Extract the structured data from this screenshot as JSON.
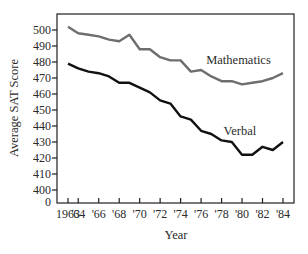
{
  "chart_data": {
    "type": "line",
    "title": "",
    "xlabel": "Year",
    "ylabel": "Average SAT Score",
    "x": [
      1963,
      1964,
      1965,
      1966,
      1967,
      1968,
      1969,
      1970,
      1971,
      1972,
      1973,
      1974,
      1975,
      1976,
      1977,
      1978,
      1979,
      1980,
      1981,
      1982,
      1983,
      1984
    ],
    "x_tick_labels": [
      "1963",
      "'64",
      "'66",
      "'68",
      "'70",
      "'72",
      "'74",
      "'76",
      "'78",
      "'80",
      "'82",
      "'84"
    ],
    "x_tick_values": [
      1963,
      1964,
      1966,
      1968,
      1970,
      1972,
      1974,
      1976,
      1978,
      1980,
      1982,
      1984
    ],
    "y_tick_labels": [
      "0",
      "400",
      "410",
      "420",
      "430",
      "440",
      "450",
      "460",
      "470",
      "480",
      "490",
      "500"
    ],
    "y_tick_values": [
      400,
      410,
      420,
      430,
      440,
      450,
      460,
      470,
      480,
      490,
      500
    ],
    "y_axis_break": true,
    "ylim": [
      400,
      510
    ],
    "grid": false,
    "legend": "inline labels",
    "series": [
      {
        "name": "Mathematics",
        "color": "#6e6e6e",
        "values": [
          502,
          498,
          497,
          496,
          494,
          493,
          497,
          488,
          488,
          483,
          481,
          481,
          474,
          475,
          471,
          468,
          468,
          466,
          467,
          468,
          470,
          473
        ]
      },
      {
        "name": "Verbal",
        "color": "#111111",
        "values": [
          479,
          476,
          474,
          473,
          471,
          467,
          467,
          464,
          461,
          456,
          454,
          446,
          444,
          437,
          435,
          431,
          430,
          422,
          422,
          427,
          425,
          430
        ]
      }
    ],
    "annotations": [
      {
        "text": "Mathematics",
        "x": 1976.5,
        "y": 481
      },
      {
        "text": "Verbal",
        "x": 1978.2,
        "y": 437
      }
    ]
  }
}
